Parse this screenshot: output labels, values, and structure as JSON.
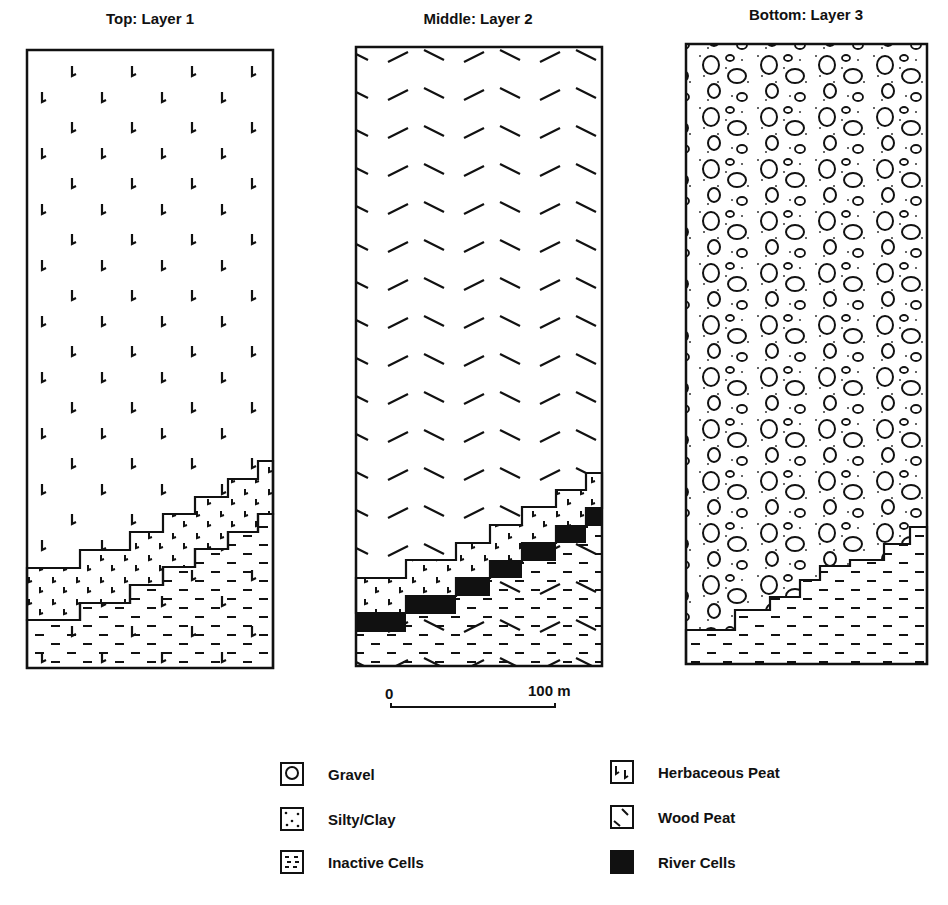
{
  "panels": [
    {
      "title": "Top: Layer 1",
      "fill": "herbaceous-peat"
    },
    {
      "title": "Middle: Layer 2",
      "fill": "wood-peat"
    },
    {
      "title": "Bottom: Layer 3",
      "fill": "gravel"
    }
  ],
  "scale_bar": {
    "start_label": "0",
    "end_label": "100 m"
  },
  "legend": {
    "items": [
      {
        "label": "Gravel",
        "icon": "gravel-icon"
      },
      {
        "label": "Silty/Clay",
        "icon": "silty-clay-icon"
      },
      {
        "label": "Inactive Cells",
        "icon": "inactive-cells-icon"
      },
      {
        "label": "Herbaceous Peat",
        "icon": "herbaceous-peat-icon"
      },
      {
        "label": "Wood Peat",
        "icon": "wood-peat-icon"
      },
      {
        "label": "River Cells",
        "icon": "river-cells-icon"
      }
    ]
  },
  "colors": {
    "ink": "#111111",
    "background": "#ffffff"
  }
}
